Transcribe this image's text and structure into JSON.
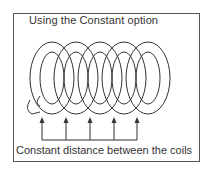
{
  "figure": {
    "title": "Using the Constant option",
    "caption": "Constant distance between the coils",
    "coil_count": 5,
    "arrow_x": [
      42,
      66,
      90,
      114,
      137
    ],
    "colors": {
      "line": "#333333",
      "frame": "#555555",
      "background": "#ffffff"
    }
  }
}
